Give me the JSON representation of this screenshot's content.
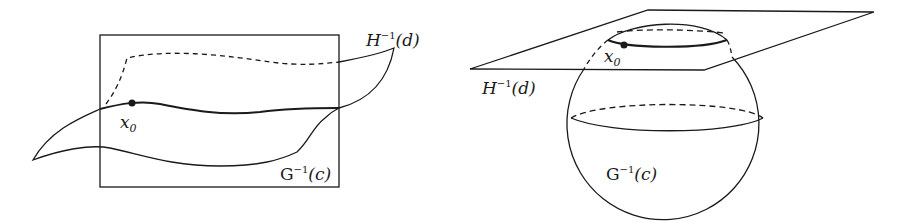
{
  "figures": [
    {
      "id": "left",
      "description": "Two surfaces inside a box intersecting along a curve through x0",
      "labels": {
        "point": {
          "base": "x",
          "sub": "0"
        },
        "surface_h": {
          "base": "H",
          "sup": "−1",
          "arg": "(d)"
        },
        "surface_g": {
          "base": "G",
          "sup": "−1",
          "arg": "(c)"
        }
      }
    },
    {
      "id": "right",
      "description": "Plane H^-1(d) cutting sphere G^-1(c) in a circle through x0",
      "labels": {
        "point": {
          "base": "x",
          "sub": "0"
        },
        "surface_h": {
          "base": "H",
          "sup": "−1",
          "arg": "(d)"
        },
        "surface_g": {
          "base": "G",
          "sup": "−1",
          "arg": "(c)"
        }
      }
    }
  ],
  "colors": {
    "stroke": "#1a1a1a",
    "background": "#ffffff"
  }
}
